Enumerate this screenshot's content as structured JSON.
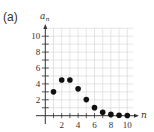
{
  "panel_label": "(a)",
  "chart_data": {
    "type": "scatter",
    "title": "",
    "xlabel": "n",
    "ylabel": "a_n",
    "ylabel_main": "a",
    "ylabel_sub": "n",
    "x": [
      1,
      2,
      3,
      4,
      5,
      6,
      7,
      8,
      9,
      10
    ],
    "values": [
      3,
      4.5,
      4.5,
      3.375,
      2.025,
      1.0125,
      0.434,
      0.163,
      0.054,
      0.016
    ],
    "xlim": [
      0,
      11
    ],
    "ylim": [
      0,
      11
    ],
    "xticks": [
      2,
      4,
      6,
      8,
      10
    ],
    "yticks": [
      2,
      4,
      6,
      8,
      10
    ],
    "grid": true,
    "legend": null
  },
  "colors": {
    "axis": "#333333",
    "grid": "#d4d4d4",
    "point": "#111111"
  }
}
